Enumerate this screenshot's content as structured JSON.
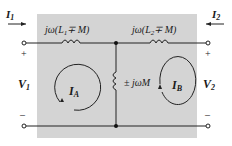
{
  "diagram": {
    "type": "T-equivalent circuit of coupled inductors",
    "colors": {
      "panel": "#d4d4d4",
      "wire": "#222222",
      "text": "#1a1a1a",
      "background": "#ffffff"
    },
    "currents": {
      "left": {
        "label": "I",
        "sub": "1"
      },
      "right": {
        "label": "I",
        "sub": "2"
      }
    },
    "voltages": {
      "left": {
        "label": "V",
        "sub": "1",
        "plus": "+",
        "minus": "–"
      },
      "right": {
        "label": "V",
        "sub": "2",
        "plus": "+",
        "minus": "–"
      }
    },
    "inductors": {
      "left": {
        "prefix": "jω(L",
        "sub": "1",
        "suffix": "∓ M)"
      },
      "right": {
        "prefix": "jω(L",
        "sub": "2",
        "suffix": "∓ M)"
      },
      "shunt": {
        "label": "± jωM"
      }
    },
    "mesh_currents": {
      "a": {
        "label": "I",
        "sub": "A"
      },
      "b": {
        "label": "I",
        "sub": "B"
      }
    }
  }
}
